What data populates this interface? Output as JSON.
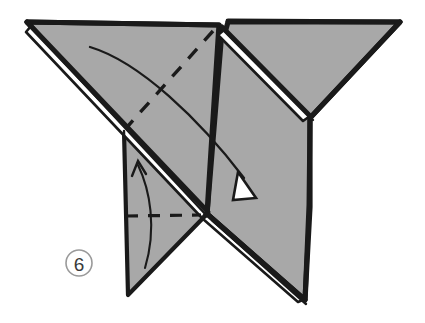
{
  "figure": {
    "kind": "origami-step-diagram",
    "background_color": "#ffffff",
    "paper_front_color": "#a8a8a8",
    "paper_back_color": "#ffffff",
    "ink_color": "#1a1a1a"
  },
  "step_badge": {
    "number": "6",
    "circle_color": "#9a9a9a",
    "text_color": "#3a3a3a",
    "cx": 79,
    "cy": 263,
    "r": 13
  },
  "shapes": {
    "left_wing": {
      "name": "left-wing-panel",
      "points": "27,22 219,25 207,214 124,131"
    },
    "right_wing": {
      "name": "right-wing-panel",
      "points": "228,22 400,22 310,118 224,36"
    },
    "center_body": {
      "name": "center-body-panel",
      "points": "222,30 310,118 310,207 305,300 207,214"
    },
    "bottom_left_flap": {
      "name": "bottom-left-flap",
      "points": "124,131 207,214 128,295"
    },
    "left_edge_sliver": {
      "name": "left-layered-edge-sliver",
      "points": "31,26 207,211 202,218 26,32"
    },
    "top_sliver": {
      "name": "top-layered-edge-sliver",
      "points": "224,30 310,116 303,121 218,35"
    },
    "bottom_sliver": {
      "name": "bottom-layered-edge-sliver",
      "points": "209,214 305,299 298,302 203,219"
    }
  },
  "fold_lines": {
    "main_diagonal_dashed": {
      "name": "diagonal-valley-fold-line",
      "path": "M 213,31 L 128,126"
    },
    "bottom_horizontal_dashed": {
      "name": "horizontal-valley-fold-line",
      "path": "M 126,216 L 201,215"
    }
  },
  "arrows": {
    "large_fold_arrow": {
      "name": "large-fold-arrow",
      "shaft_path": "M 90,47 C 140,62 200,120 244,178",
      "head_points": "238,172 256,198 233,200",
      "direction": "down-right"
    },
    "small_flap_arrow": {
      "name": "small-flap-arrow",
      "shaft_path": "M 145,268 C 157,228 150,190 138,165",
      "head_points": "132,176 138,161 146,174",
      "direction": "up"
    }
  }
}
